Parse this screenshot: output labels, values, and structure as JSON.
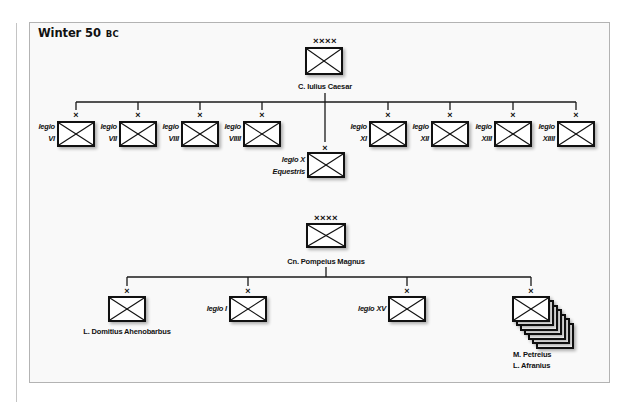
{
  "title": {
    "main": "Winter 50",
    "suffix": "BC"
  },
  "caesar": {
    "echelon": "××××",
    "commander": "C. Iulius Caesar",
    "legions": [
      {
        "echelon": "×",
        "line1": "legio",
        "line2": "VI"
      },
      {
        "echelon": "×",
        "line1": "legio",
        "line2": "VII"
      },
      {
        "echelon": "×",
        "line1": "legio",
        "line2": "VIII"
      },
      {
        "echelon": "×",
        "line1": "legio",
        "line2": "VIIII"
      },
      {
        "echelon": "×",
        "line1": "legio X",
        "line2": "Equestris"
      },
      {
        "echelon": "×",
        "line1": "legio",
        "line2": "XI"
      },
      {
        "echelon": "×",
        "line1": "legio",
        "line2": "XII"
      },
      {
        "echelon": "×",
        "line1": "legio",
        "line2": "XIII"
      },
      {
        "echelon": "×",
        "line1": "legio",
        "line2": "XIIII"
      }
    ]
  },
  "pompey": {
    "echelon": "××××",
    "commander": "Cn. Pompeius Magnus",
    "subordinates": [
      {
        "echelon": "×",
        "label": "L. Domitius Ahenobarbus"
      },
      {
        "echelon": "×",
        "label": "legio I"
      },
      {
        "echelon": "×",
        "label": "legio XV"
      },
      {
        "echelon": "×",
        "line1": "M. Petreius",
        "line2": "L. Afranius",
        "stacked_units": 7
      }
    ]
  },
  "colors": {
    "ink": "#111111",
    "frame": "#b3b3b3",
    "background": "#f9f9f9"
  }
}
